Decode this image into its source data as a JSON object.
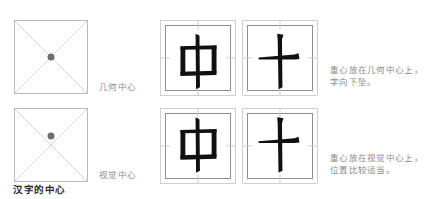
{
  "caption": "汉字的中心",
  "left_column": {
    "squares": [
      {
        "name": "geometric-center",
        "label": "几何中心",
        "dot_x_pct": 50,
        "dot_y_pct": 50,
        "dot_color": "#6e6e6e",
        "border_color": "#b9b9b9",
        "diagonal_color": "#d2d2d2"
      },
      {
        "name": "visual-center",
        "label": "视觉中心",
        "dot_x_pct": 50,
        "dot_y_pct": 38,
        "dot_color": "#6e6e6e",
        "border_color": "#b9b9b9",
        "diagonal_color": "#d2d2d2"
      }
    ]
  },
  "glyph_boxes": [
    {
      "name": "zhong-geometric",
      "character": "中",
      "row": "top",
      "vertical_offset_pct": 0,
      "outer_border_color": "#cfcfcf",
      "inner_border_color": "#8f8f8f",
      "guide_color": "#c6c6c6",
      "stroke_color": "#101010"
    },
    {
      "name": "shi-geometric",
      "character": "十",
      "row": "top",
      "vertical_offset_pct": 0,
      "outer_border_color": "#cfcfcf",
      "inner_border_color": "#8f8f8f",
      "guide_color": "#c6c6c6",
      "stroke_color": "#101010"
    },
    {
      "name": "zhong-visual",
      "character": "中",
      "row": "bottom",
      "vertical_offset_pct": -6,
      "outer_border_color": "#cfcfcf",
      "inner_border_color": "#8f8f8f",
      "guide_color": "#c6c6c6",
      "stroke_color": "#101010"
    },
    {
      "name": "shi-visual",
      "character": "十",
      "row": "bottom",
      "vertical_offset_pct": -6,
      "outer_border_color": "#cfcfcf",
      "inner_border_color": "#8f8f8f",
      "guide_color": "#c6c6c6",
      "stroke_color": "#101010"
    }
  ],
  "notes": {
    "geometric": "重心放在几何中心上，字向下坠。",
    "visual": "重心放在视觉中心上，位置比较适当。"
  }
}
